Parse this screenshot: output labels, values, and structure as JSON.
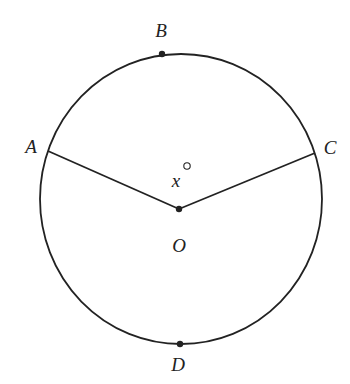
{
  "diagram": {
    "type": "circle-central-angle",
    "circle": {
      "cx": 181,
      "cy": 199,
      "rx": 141,
      "ry": 145,
      "stroke": "#222222"
    },
    "center": {
      "label": "O",
      "x": 179,
      "y": 209
    },
    "points": [
      {
        "label": "A",
        "x": 48,
        "y": 151,
        "dot": false,
        "label_x": 31,
        "label_y": 153
      },
      {
        "label": "B",
        "x": 162,
        "y": 54,
        "dot": true,
        "label_x": 161,
        "label_y": 37
      },
      {
        "label": "C",
        "x": 315,
        "y": 153,
        "dot": false,
        "label_x": 330,
        "label_y": 154
      },
      {
        "label": "D",
        "x": 180,
        "y": 344,
        "dot": true,
        "label_x": 178,
        "label_y": 370
      }
    ],
    "segments": [
      {
        "from": "O",
        "to": "A"
      },
      {
        "from": "O",
        "to": "C"
      }
    ],
    "angle_label": {
      "variable": "x",
      "unit": "°",
      "text": "x°",
      "x": 176,
      "y": 187
    },
    "labels": {
      "A": "A",
      "B": "B",
      "C": "C",
      "D": "D",
      "O": "O",
      "x": "x",
      "degree": "°"
    }
  }
}
